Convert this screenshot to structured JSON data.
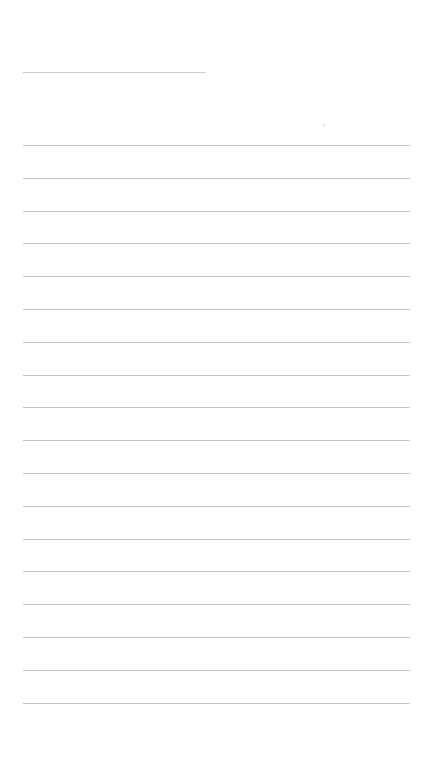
{
  "page": {
    "type": "lined-paper",
    "background": "#ffffff",
    "line_color": "#c4c4c4",
    "header_line": {
      "top": 72,
      "left": 23,
      "width": 183
    },
    "ruled_lines": {
      "count": 18,
      "first_top": 145,
      "spacing": 32.8,
      "left": 23,
      "right": 410
    }
  }
}
